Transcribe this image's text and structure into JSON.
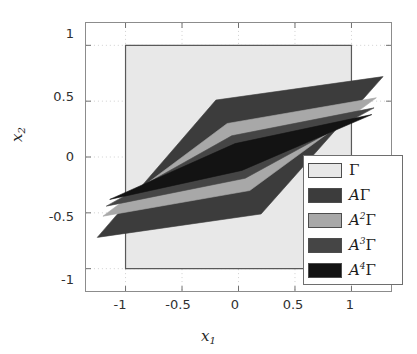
{
  "chart_data": {
    "type": "area",
    "title": "",
    "xlabel": "x₁",
    "ylabel": "x₂",
    "xlim": [
      -1.35,
      1.35
    ],
    "ylim": [
      -1.2,
      1.2
    ],
    "grid": true,
    "xticks": [
      -1,
      -0.5,
      0,
      0.5,
      1
    ],
    "xtick_labels": [
      "-1",
      "-0.5",
      "0",
      "0.5",
      "1"
    ],
    "yticks": [
      -1,
      -0.5,
      0,
      0.5,
      1
    ],
    "ytick_labels": [
      "-1",
      "-0.5",
      "0",
      "0.5",
      "1"
    ],
    "legend_position": "lower-right",
    "series": [
      {
        "name": "Γ",
        "label_plain": "Γ",
        "color": "#e8e8e8",
        "edge": "#595959",
        "polygon": [
          [
            -1,
            -1
          ],
          [
            1,
            -1
          ],
          [
            1,
            1
          ],
          [
            -1,
            1
          ]
        ]
      },
      {
        "name": "AΓ",
        "label_plain": "AΓ",
        "color": "#3c3c3c",
        "edge": "#3c3c3c",
        "polygon": [
          [
            -1.25,
            -0.72
          ],
          [
            0.2,
            -0.51
          ],
          [
            1.28,
            0.72
          ],
          [
            -0.2,
            0.51
          ]
        ]
      },
      {
        "name": "A²Γ",
        "label_plain": "A2Γ",
        "color": "#a8a8a8",
        "edge": "#a8a8a8",
        "polygon": [
          [
            -1.2,
            -0.53
          ],
          [
            0.1,
            -0.3
          ],
          [
            1.22,
            0.53
          ],
          [
            -0.1,
            0.3
          ]
        ]
      },
      {
        "name": "A³Γ",
        "label_plain": "A3Γ",
        "color": "#454545",
        "edge": "#454545",
        "polygon": [
          [
            -1.17,
            -0.44
          ],
          [
            0.06,
            -0.19
          ],
          [
            1.2,
            0.44
          ],
          [
            -0.06,
            0.19
          ]
        ]
      },
      {
        "name": "A⁴Γ",
        "label_plain": "A4Γ",
        "color": "#131313",
        "edge": "#131313",
        "polygon": [
          [
            -1.14,
            -0.38
          ],
          [
            0.03,
            -0.12
          ],
          [
            1.18,
            0.38
          ],
          [
            -0.03,
            0.12
          ]
        ]
      }
    ]
  },
  "axes": {
    "x_label_base": "x",
    "x_label_sub": "1",
    "y_label_base": "x",
    "y_label_sub": "2"
  },
  "ticks": {
    "x": [
      "-1",
      "-0.5",
      "0",
      "0.5",
      "1"
    ],
    "y": [
      "1",
      "0.5",
      "0",
      "-0.5",
      "-1"
    ]
  },
  "legend": {
    "items": [
      {
        "gamma": "Γ",
        "prefix": "",
        "exp": ""
      },
      {
        "gamma": "Γ",
        "prefix": "A",
        "exp": ""
      },
      {
        "gamma": "Γ",
        "prefix": "A",
        "exp": "2"
      },
      {
        "gamma": "Γ",
        "prefix": "A",
        "exp": "3"
      },
      {
        "gamma": "Γ",
        "prefix": "A",
        "exp": "4"
      }
    ]
  }
}
